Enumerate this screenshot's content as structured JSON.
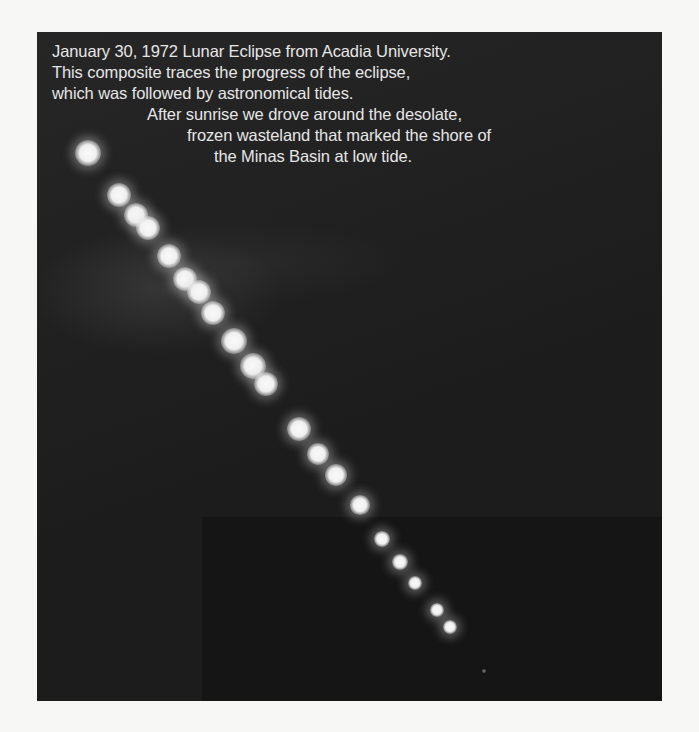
{
  "photo": {
    "description": "Composite photograph of lunar eclipse progression",
    "background_color": "#1c1c1c",
    "page_color": "#f7f7f5",
    "caption": {
      "lines": [
        "January 30, 1972 Lunar Eclipse from Acadia University.",
        "This composite traces the progress of the eclipse,",
        "which was followed by astronomical tides.",
        "After sunrise we drove around the desolate,",
        "frozen wasteland that marked the shore of",
        "the Minas Basin at low tide."
      ]
    },
    "moons": [
      {
        "x": 88,
        "y": 153,
        "r": 11
      },
      {
        "x": 119,
        "y": 195,
        "r": 10
      },
      {
        "x": 136,
        "y": 215,
        "r": 10
      },
      {
        "x": 148,
        "y": 228,
        "r": 10
      },
      {
        "x": 169,
        "y": 256,
        "r": 10
      },
      {
        "x": 185,
        "y": 279,
        "r": 10
      },
      {
        "x": 199,
        "y": 292,
        "r": 10
      },
      {
        "x": 213,
        "y": 313,
        "r": 10
      },
      {
        "x": 234,
        "y": 341,
        "r": 11
      },
      {
        "x": 253,
        "y": 366,
        "r": 11
      },
      {
        "x": 266,
        "y": 384,
        "r": 10
      },
      {
        "x": 299,
        "y": 429,
        "r": 10
      },
      {
        "x": 318,
        "y": 454,
        "r": 9
      },
      {
        "x": 336,
        "y": 475,
        "r": 9
      },
      {
        "x": 360,
        "y": 505,
        "r": 8
      },
      {
        "x": 382,
        "y": 539,
        "r": 7
      },
      {
        "x": 400,
        "y": 562,
        "r": 7
      },
      {
        "x": 415,
        "y": 583,
        "r": 6
      },
      {
        "x": 437,
        "y": 610,
        "r": 6
      },
      {
        "x": 450,
        "y": 627,
        "r": 6
      },
      {
        "x": 484,
        "y": 671,
        "r": 2
      }
    ]
  }
}
